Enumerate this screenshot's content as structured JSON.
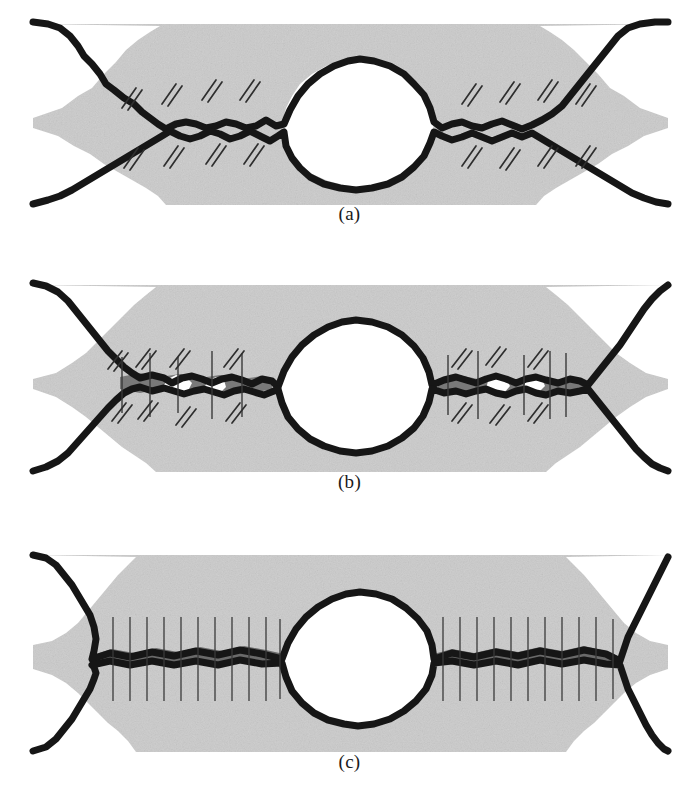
{
  "figure": {
    "background_color": "#ffffff",
    "matrix_color": "#d9d9d9",
    "matrix_color_dark": "#c9c9c9",
    "outline_color": "#161616",
    "band_color": "#5a5a5a",
    "hatch_color": "#2e2e2e",
    "line_color": "#3a3a3a",
    "void_fill": "#ffffff",
    "width": 699,
    "height": 808
  },
  "panels": [
    {
      "id": "a",
      "caption": "(a)",
      "caption_y": 213,
      "top": 22,
      "matrix_top": 24,
      "matrix_bottom": 205,
      "matrix_left": 33,
      "matrix_right": 668,
      "description": "Large lenticular void at centre with two smaller necked interfacial voids left and right; diagonal double-slash hatch marks above and below each necked region.",
      "annotation_style": "diagonal-double-slash",
      "vertical_lines": 0,
      "hatch_groups": [
        {
          "side": "left",
          "position": "above",
          "count": 4
        },
        {
          "side": "left",
          "position": "below",
          "count": 4
        },
        {
          "side": "right",
          "position": "above",
          "count": 4
        },
        {
          "side": "right",
          "position": "below",
          "count": 4
        }
      ],
      "central_void": {
        "cx": 358,
        "cy": 122,
        "rx": 90,
        "ry": 62,
        "closed": false
      },
      "bonded_band": false
    },
    {
      "id": "b",
      "caption": "(b)",
      "caption_y": 488,
      "top": 283,
      "matrix_top": 285,
      "matrix_bottom": 472,
      "matrix_left": 33,
      "matrix_right": 668,
      "description": "Central void reduced; flanking interfaces partially bonded into a grey band containing small residual voids. Both vertical bond lines and diagonal hatch marks are present.",
      "annotation_style": "mixed-vertical-and-diagonal",
      "vertical_lines": 10,
      "hatch_groups": [
        {
          "side": "left",
          "position": "above",
          "count": 4
        },
        {
          "side": "left",
          "position": "below",
          "count": 4
        },
        {
          "side": "right",
          "position": "above",
          "count": 3
        },
        {
          "side": "right",
          "position": "below",
          "count": 3
        }
      ],
      "central_void": {
        "cx": 358,
        "cy": 392,
        "rx": 88,
        "ry": 60,
        "closed": false
      },
      "bonded_band": true
    },
    {
      "id": "c",
      "caption": "(c)",
      "caption_y": 768,
      "top": 553,
      "matrix_top": 555,
      "matrix_bottom": 752,
      "matrix_left": 33,
      "matrix_right": 668,
      "description": "Flanking interfaces fully consolidated into continuous dark bonded bands crossed by closely spaced vertical lines; only the central void remains open.",
      "annotation_style": "vertical-lines-only",
      "vertical_lines": 22,
      "hatch_groups": [],
      "central_void": {
        "cx": 356,
        "cy": 661,
        "rx": 86,
        "ry": 62,
        "closed": false
      },
      "bonded_band": true
    }
  ]
}
